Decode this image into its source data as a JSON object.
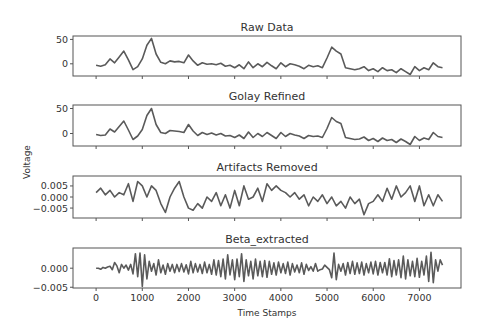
{
  "figure": {
    "ylabel": "Voltage",
    "xlabel": "Time Stamps",
    "line_color": "#5a5a5a",
    "frame_color": "#555555"
  },
  "chart_data": [
    {
      "type": "line",
      "title": "Raw Data",
      "xlabel": "",
      "ylabel": "Voltage",
      "xlim": [
        -500,
        7900
      ],
      "ylim": [
        -25,
        57
      ],
      "yticks": [
        0,
        50
      ],
      "ytick_labels": [
        "0",
        "50"
      ],
      "xticks": [
        0,
        1000,
        2000,
        3000,
        4000,
        5000,
        6000,
        7000
      ],
      "x": [
        0,
        100,
        200,
        300,
        400,
        500,
        600,
        700,
        800,
        900,
        1000,
        1100,
        1200,
        1300,
        1400,
        1500,
        1600,
        1700,
        1800,
        1900,
        2000,
        2100,
        2200,
        2300,
        2400,
        2500,
        2600,
        2700,
        2800,
        2900,
        3000,
        3100,
        3200,
        3300,
        3400,
        3500,
        3600,
        3700,
        3800,
        3900,
        4000,
        4100,
        4200,
        4300,
        4400,
        4500,
        4600,
        4700,
        4800,
        4900,
        5000,
        5100,
        5200,
        5300,
        5400,
        5500,
        5600,
        5700,
        5800,
        5900,
        6000,
        6100,
        6200,
        6300,
        6400,
        6500,
        6600,
        6700,
        6800,
        6900,
        7000,
        7100,
        7200,
        7300,
        7400,
        7500
      ],
      "y": [
        -3,
        -5,
        -2,
        10,
        2,
        14,
        26,
        8,
        -12,
        -6,
        10,
        38,
        52,
        20,
        3,
        0,
        6,
        4,
        5,
        2,
        18,
        6,
        -3,
        2,
        -1,
        0,
        -2,
        1,
        -5,
        -3,
        -8,
        -2,
        -10,
        4,
        -8,
        0,
        -6,
        3,
        -4,
        -10,
        2,
        -6,
        0,
        -2,
        -5,
        -10,
        -3,
        -6,
        -4,
        -8,
        12,
        34,
        26,
        20,
        -8,
        -10,
        -12,
        -10,
        -6,
        -14,
        -10,
        -16,
        -8,
        -14,
        -12,
        -18,
        -10,
        -16,
        -22,
        -6,
        -14,
        -8,
        -12,
        2,
        -6,
        -8
      ]
    },
    {
      "type": "line",
      "title": "Golay Refined",
      "xlabel": "",
      "ylabel": "Voltage",
      "xlim": [
        -500,
        7900
      ],
      "ylim": [
        -25,
        57
      ],
      "yticks": [
        0,
        50
      ],
      "ytick_labels": [
        "0",
        "50"
      ],
      "xticks": [
        0,
        1000,
        2000,
        3000,
        4000,
        5000,
        6000,
        7000
      ],
      "x": [
        0,
        100,
        200,
        300,
        400,
        500,
        600,
        700,
        800,
        900,
        1000,
        1100,
        1200,
        1300,
        1400,
        1500,
        1600,
        1700,
        1800,
        1900,
        2000,
        2100,
        2200,
        2300,
        2400,
        2500,
        2600,
        2700,
        2800,
        2900,
        3000,
        3100,
        3200,
        3300,
        3400,
        3500,
        3600,
        3700,
        3800,
        3900,
        4000,
        4100,
        4200,
        4300,
        4400,
        4500,
        4600,
        4700,
        4800,
        4900,
        5000,
        5100,
        5200,
        5300,
        5400,
        5500,
        5600,
        5700,
        5800,
        5900,
        6000,
        6100,
        6200,
        6300,
        6400,
        6500,
        6600,
        6700,
        6800,
        6900,
        7000,
        7100,
        7200,
        7300,
        7400,
        7500
      ],
      "y": [
        -2,
        -4,
        -3,
        9,
        3,
        14,
        25,
        7,
        -12,
        -5,
        8,
        36,
        50,
        18,
        2,
        0,
        6,
        5,
        4,
        2,
        18,
        5,
        -4,
        2,
        -2,
        1,
        -3,
        0,
        -5,
        -4,
        -8,
        -3,
        -10,
        3,
        -8,
        0,
        -6,
        2,
        -4,
        -10,
        2,
        -6,
        0,
        -3,
        -5,
        -10,
        -4,
        -6,
        -5,
        -8,
        10,
        32,
        24,
        20,
        -8,
        -10,
        -12,
        -11,
        -7,
        -14,
        -10,
        -16,
        -9,
        -14,
        -12,
        -18,
        -11,
        -16,
        -22,
        -6,
        -14,
        -9,
        -12,
        2,
        -6,
        -8
      ]
    },
    {
      "type": "line",
      "title": "Artifacts Removed",
      "xlabel": "",
      "ylabel": "Voltage",
      "xlim": [
        -500,
        7900
      ],
      "ylim": [
        -0.0095,
        0.0095
      ],
      "yticks": [
        0.005,
        0.0,
        -0.005
      ],
      "ytick_labels": [
        "0.005",
        "0.000",
        "−0.005"
      ],
      "xticks": [
        0,
        1000,
        2000,
        3000,
        4000,
        5000,
        6000,
        7000
      ],
      "x": [
        0,
        100,
        200,
        300,
        400,
        500,
        600,
        700,
        800,
        900,
        1000,
        1100,
        1200,
        1300,
        1400,
        1500,
        1600,
        1700,
        1800,
        1900,
        2000,
        2100,
        2200,
        2300,
        2400,
        2500,
        2600,
        2700,
        2800,
        2900,
        3000,
        3100,
        3200,
        3300,
        3400,
        3500,
        3600,
        3700,
        3800,
        3900,
        4000,
        4100,
        4200,
        4300,
        4400,
        4500,
        4600,
        4700,
        4800,
        4900,
        5000,
        5100,
        5200,
        5300,
        5400,
        5500,
        5600,
        5700,
        5800,
        5900,
        6000,
        6100,
        6200,
        6300,
        6400,
        6500,
        6600,
        6700,
        6800,
        6900,
        7000,
        7100,
        7200,
        7300,
        7400,
        7500
      ],
      "y": [
        0.002,
        0.004,
        0.001,
        0.003,
        0.0,
        0.002,
        0.001,
        0.006,
        -0.002,
        0.007,
        0.005,
        0.0,
        0.005,
        0.003,
        -0.003,
        -0.007,
        0.0,
        0.004,
        0.007,
        0.0,
        -0.005,
        -0.006,
        -0.003,
        -0.005,
        0.0,
        -0.002,
        0.002,
        -0.004,
        0.001,
        -0.005,
        0.003,
        -0.004,
        0.005,
        -0.001,
        0.0,
        0.004,
        -0.002,
        0.006,
        0.003,
        0.005,
        0.003,
        0.002,
        0.0,
        0.002,
        -0.001,
        0.001,
        -0.004,
        0.0,
        -0.002,
        0.001,
        -0.003,
        0.0,
        -0.004,
        -0.002,
        -0.005,
        0.0,
        -0.003,
        -0.001,
        -0.008,
        -0.003,
        -0.002,
        0.001,
        -0.002,
        0.004,
        -0.001,
        0.005,
        0.0,
        0.002,
        0.005,
        -0.002,
        0.005,
        -0.004,
        0.001,
        -0.004,
        0.001,
        -0.002
      ]
    },
    {
      "type": "line",
      "title": "Beta_extracted",
      "xlabel": "Time Stamps",
      "ylabel": "Voltage",
      "xlim": [
        -500,
        7900
      ],
      "ylim": [
        -0.0052,
        0.0053
      ],
      "yticks": [
        0.0,
        -0.005
      ],
      "ytick_labels": [
        "0.000",
        "−0.005"
      ],
      "xticks": [
        0,
        1000,
        2000,
        3000,
        4000,
        5000,
        6000,
        7000
      ],
      "xtick_labels": [
        "0",
        "1000",
        "2000",
        "3000",
        "4000",
        "5000",
        "6000",
        "7000"
      ],
      "x": [
        0,
        50,
        100,
        150,
        200,
        250,
        300,
        350,
        400,
        450,
        500,
        550,
        600,
        650,
        700,
        750,
        800,
        850,
        900,
        950,
        1000,
        1050,
        1100,
        1150,
        1200,
        1250,
        1300,
        1350,
        1400,
        1450,
        1500,
        1550,
        1600,
        1650,
        1700,
        1750,
        1800,
        1850,
        1900,
        1950,
        2000,
        2050,
        2100,
        2150,
        2200,
        2250,
        2300,
        2350,
        2400,
        2450,
        2500,
        2550,
        2600,
        2650,
        2700,
        2750,
        2800,
        2850,
        2900,
        2950,
        3000,
        3050,
        3100,
        3150,
        3200,
        3250,
        3300,
        3350,
        3400,
        3450,
        3500,
        3550,
        3600,
        3650,
        3700,
        3750,
        3800,
        3850,
        3900,
        3950,
        4000,
        4050,
        4100,
        4150,
        4200,
        4250,
        4300,
        4350,
        4400,
        4450,
        4500,
        4550,
        4600,
        4650,
        4700,
        4750,
        4800,
        4850,
        4900,
        4950,
        5000,
        5050,
        5100,
        5150,
        5200,
        5250,
        5300,
        5350,
        5400,
        5450,
        5500,
        5550,
        5600,
        5650,
        5700,
        5750,
        5800,
        5850,
        5900,
        5950,
        6000,
        6050,
        6100,
        6150,
        6200,
        6250,
        6300,
        6350,
        6400,
        6450,
        6500,
        6550,
        6600,
        6650,
        6700,
        6750,
        6800,
        6850,
        6900,
        6950,
        7000,
        7050,
        7100,
        7150,
        7200,
        7250,
        7300,
        7350,
        7400,
        7450,
        7500
      ],
      "y": [
        0.0,
        0.0,
        -0.0003,
        0.0002,
        0.0,
        0.0003,
        0.0005,
        -0.0004,
        0.0015,
        0.0006,
        -0.0012,
        0.001,
        0.0,
        0.0008,
        -0.0005,
        0.001,
        -0.0015,
        0.0038,
        -0.0022,
        0.004,
        -0.0048,
        0.0035,
        -0.0028,
        0.0018,
        -0.0008,
        0.0012,
        -0.0018,
        0.0022,
        -0.0012,
        0.0008,
        -0.0016,
        0.0012,
        -0.0008,
        0.001,
        -0.0012,
        0.001,
        -0.0009,
        0.0012,
        -0.001,
        0.0009,
        -0.0015,
        0.0018,
        -0.0012,
        0.0012,
        -0.001,
        0.001,
        -0.0014,
        0.0016,
        -0.0012,
        0.001,
        -0.0016,
        0.0022,
        -0.0018,
        0.002,
        -0.0022,
        0.0024,
        -0.0028,
        0.0035,
        -0.0018,
        0.0022,
        -0.003,
        0.0024,
        -0.0022,
        0.0038,
        -0.0035,
        0.0022,
        -0.002,
        0.0018,
        -0.0028,
        0.0024,
        -0.002,
        0.0018,
        -0.0022,
        0.002,
        -0.0024,
        0.0018,
        -0.0016,
        0.0014,
        -0.0018,
        0.0016,
        -0.0012,
        0.0012,
        -0.0014,
        0.0016,
        -0.0018,
        0.0012,
        -0.001,
        0.0008,
        -0.0012,
        0.0014,
        -0.0016,
        0.001,
        -0.0006,
        0.0004,
        -0.0008,
        0.0012,
        -0.0008,
        -0.0004,
        -0.0002,
        0.0008,
        0.0002,
        -0.0004,
        -0.0025,
        0.004,
        -0.003,
        0.001,
        -0.0008,
        0.0012,
        -0.0018,
        0.0015,
        -0.0014,
        0.0018,
        -0.0016,
        0.0014,
        -0.0014,
        0.0016,
        -0.0018,
        0.0012,
        -0.0012,
        0.0016,
        -0.0015,
        0.0018,
        -0.0018,
        0.0015,
        -0.0012,
        0.0015,
        -0.0018,
        0.0025,
        -0.0022,
        0.002,
        -0.0018,
        0.0022,
        -0.0025,
        0.0032,
        -0.0028,
        0.0022,
        -0.002,
        0.0018,
        -0.0022,
        0.0026,
        -0.0024,
        0.0018,
        -0.0018,
        0.0032,
        -0.0035,
        0.0042,
        -0.0038,
        0.0022,
        -0.0008,
        0.0022,
        0.0008,
        -0.0002
      ]
    }
  ]
}
